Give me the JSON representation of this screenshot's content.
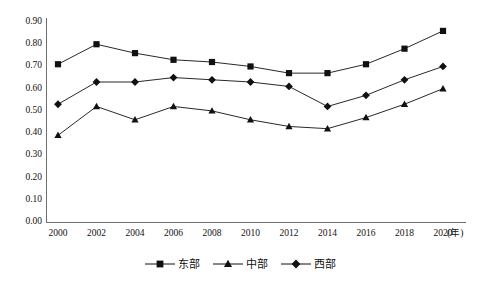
{
  "chart_data": {
    "type": "line",
    "title": "",
    "xlabel": "年",
    "ylabel": "",
    "categories": [
      2000,
      2002,
      2004,
      2006,
      2008,
      2010,
      2012,
      2014,
      2016,
      2018,
      2020
    ],
    "xtick_labels": [
      "2000",
      "2002",
      "2004",
      "2006",
      "2008",
      "2010",
      "2012",
      "2014",
      "2016",
      "2018",
      "2020"
    ],
    "x_axis_unit_label": "(年)",
    "ytick_labels": [
      "0.00",
      "0.10",
      "0.20",
      "0.30",
      "0.40",
      "0.50",
      "0.60",
      "0.70",
      "0.80",
      "0.90"
    ],
    "ytick_values": [
      0.0,
      0.1,
      0.2,
      0.3,
      0.4,
      0.5,
      0.6,
      0.7,
      0.8,
      0.9
    ],
    "ylim": [
      0.0,
      0.9
    ],
    "grid": false,
    "legend_position": "bottom-center",
    "series": [
      {
        "name": "东部",
        "marker": "square",
        "values": [
          0.71,
          0.8,
          0.76,
          0.73,
          0.72,
          0.7,
          0.67,
          0.67,
          0.71,
          0.78,
          0.86
        ]
      },
      {
        "name": "中部",
        "marker": "triangle",
        "values": [
          0.39,
          0.52,
          0.46,
          0.52,
          0.5,
          0.46,
          0.43,
          0.42,
          0.47,
          0.53,
          0.6
        ]
      },
      {
        "name": "西部",
        "marker": "diamond",
        "values": [
          0.53,
          0.63,
          0.63,
          0.65,
          0.64,
          0.63,
          0.61,
          0.52,
          0.57,
          0.64,
          0.7
        ]
      }
    ]
  },
  "legend": {
    "items": [
      {
        "label": "东部",
        "marker": "square"
      },
      {
        "label": "中部",
        "marker": "triangle"
      },
      {
        "label": "西部",
        "marker": "diamond"
      }
    ]
  },
  "caption": {
    "text": ""
  },
  "colors": {
    "series": "#111111",
    "axis": "#6f6f6f",
    "text": "#111111",
    "background": "#ffffff"
  }
}
